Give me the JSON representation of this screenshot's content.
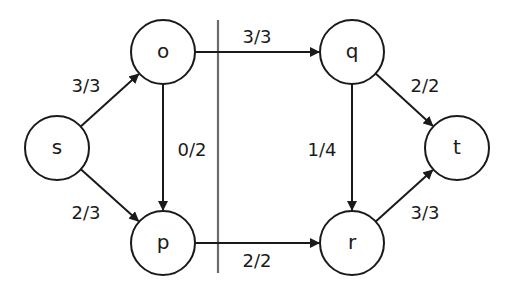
{
  "diagram": {
    "type": "flow-network",
    "nodes": [
      {
        "id": "s",
        "label": "s",
        "x": 57,
        "y": 148
      },
      {
        "id": "o",
        "label": "o",
        "x": 163,
        "y": 52
      },
      {
        "id": "p",
        "label": "p",
        "x": 163,
        "y": 243
      },
      {
        "id": "q",
        "label": "q",
        "x": 352,
        "y": 52
      },
      {
        "id": "r",
        "label": "r",
        "x": 352,
        "y": 243
      },
      {
        "id": "t",
        "label": "t",
        "x": 457,
        "y": 148
      }
    ],
    "node_radius": 32,
    "edges": [
      {
        "from": "s",
        "to": "o",
        "label": "3/3",
        "flow": 3,
        "capacity": 3,
        "label_x": 86,
        "label_y": 85
      },
      {
        "from": "s",
        "to": "p",
        "label": "2/3",
        "flow": 2,
        "capacity": 3,
        "label_x": 86,
        "label_y": 212
      },
      {
        "from": "o",
        "to": "p",
        "label": "0/2",
        "flow": 0,
        "capacity": 2,
        "label_x": 192,
        "label_y": 149
      },
      {
        "from": "o",
        "to": "q",
        "label": "3/3",
        "flow": 3,
        "capacity": 3,
        "label_x": 257,
        "label_y": 36
      },
      {
        "from": "p",
        "to": "r",
        "label": "2/2",
        "flow": 2,
        "capacity": 2,
        "label_x": 257,
        "label_y": 260
      },
      {
        "from": "q",
        "to": "r",
        "label": "1/4",
        "flow": 1,
        "capacity": 4,
        "label_x": 322,
        "label_y": 149
      },
      {
        "from": "q",
        "to": "t",
        "label": "2/2",
        "flow": 2,
        "capacity": 2,
        "label_x": 425,
        "label_y": 85
      },
      {
        "from": "r",
        "to": "t",
        "label": "3/3",
        "flow": 3,
        "capacity": 3,
        "label_x": 425,
        "label_y": 212
      }
    ],
    "cut": {
      "x": 218,
      "y1": 20,
      "y2": 273,
      "color": "#6b6b6b"
    },
    "colors": {
      "stroke": "#1a1a1a",
      "background": "#ffffff"
    }
  }
}
